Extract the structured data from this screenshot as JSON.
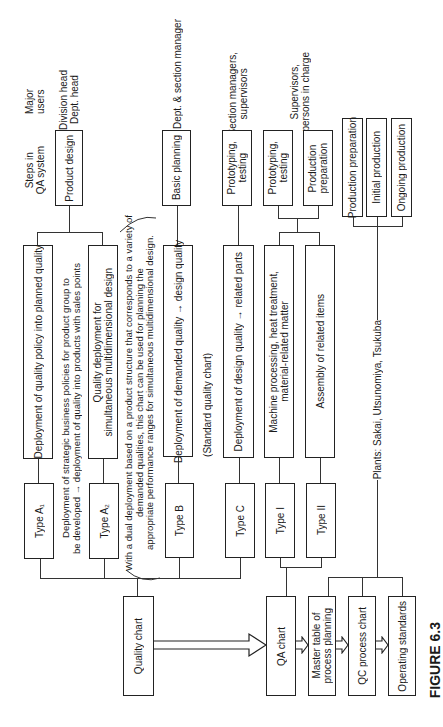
{
  "figure_label": "FIGURE 6.3",
  "headers": {
    "steps": "Steps in\nQA system",
    "users": "Major\nusers"
  },
  "steps": [
    {
      "id": "product-design",
      "label": "Product design",
      "users": "Division head\nDept. head"
    },
    {
      "id": "basic-planning",
      "label": "Basic planning",
      "users": "Dept. & section manager"
    },
    {
      "id": "prototyping-c",
      "label": "Prototyping,\ntesting",
      "users": "Section managers,\nsupervisors"
    },
    {
      "id": "prototyping-i",
      "label": "Prototyping,\ntesting",
      "users": ""
    },
    {
      "id": "production-prep-ii",
      "label": "Production\npreparation",
      "users": "Supervisors,\npersons in charge"
    },
    {
      "id": "production-preparation",
      "label": "Production preparation"
    },
    {
      "id": "initial-production",
      "label": "Initial production"
    },
    {
      "id": "ongoing-production",
      "label": "Ongoing production"
    }
  ],
  "deployments": {
    "a1": "Deployment of quality policy into planned quality",
    "a1_note": "Deployment of strategic business policies for product group to\nbe developed → deployment of quality into products with sales points",
    "a2": "Quality deployment for\nsimultaneous multidimensional design",
    "a2_note": "With a dual deployment based on a product structure that corresponds to a variety of\ndemanded qualities, this chart can be used for planning the\nappropriate performance ranges for simultaneous multidimensional design.",
    "b": "Deployment of demanded quality → design quality",
    "b_note": "(Standard quality chart)",
    "c": "Deployment of design quality → related parts",
    "i": "Machine processing, heat treatment,\nmaterial-related matter",
    "ii": "Assembly of related items",
    "plants": "Plants: Sakai, Utsunomiya, Tsukuba"
  },
  "types": {
    "a1": "Type A₁",
    "a2": "Type A₂",
    "b": "Type B",
    "c": "Type C",
    "i": "Type I",
    "ii": "Type II"
  },
  "charts": {
    "quality_chart": "Quality chart",
    "qa_chart": "QA chart",
    "master_table": "Master table of\nprocess planning",
    "qc_process_chart": "QC process chart",
    "operating_standards": "Operating standards"
  }
}
